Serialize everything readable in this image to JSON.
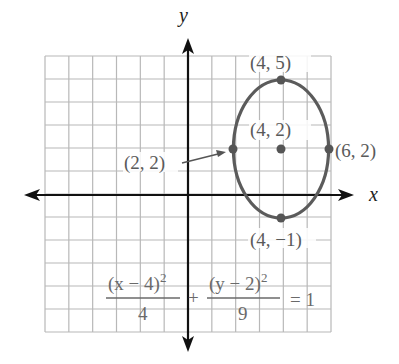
{
  "chart_data": {
    "type": "line",
    "title": "",
    "xlabel": "x",
    "ylabel": "y",
    "xlim": [
      -6,
      6
    ],
    "ylim": [
      -6,
      6
    ],
    "grid": true,
    "series": [
      {
        "name": "ellipse",
        "center": [
          4,
          2
        ],
        "a_horizontal": 2,
        "b_vertical": 3,
        "color": "#5b5b5b"
      }
    ],
    "points": [
      {
        "x": 4,
        "y": 5,
        "label": "(4, 5)"
      },
      {
        "x": 4,
        "y": 2,
        "label": "(4, 2)"
      },
      {
        "x": 6,
        "y": 2,
        "label": "(6, 2)"
      },
      {
        "x": 2,
        "y": 2,
        "label": "(2, 2)"
      },
      {
        "x": 4,
        "y": -1,
        "label": "(4, −1)"
      }
    ],
    "equation": {
      "num1": "(x − 4)",
      "exp1": "2",
      "den1": "4",
      "plus": "+",
      "num2": "(y − 2)",
      "exp2": "2",
      "den2": "9",
      "rhs": "= 1"
    }
  }
}
